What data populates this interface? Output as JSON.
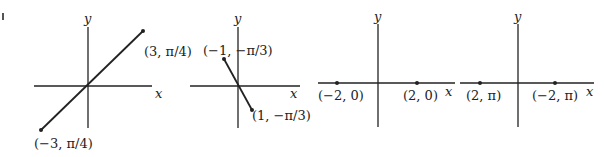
{
  "figure_mark": "|",
  "graphs": [
    {
      "x_label": "x",
      "y_label": "y",
      "points": [
        {
          "label": "(3, π/4)",
          "r": 3,
          "theta": "π/4"
        },
        {
          "label": "(−3, π/4)",
          "r": -3,
          "theta": "π/4"
        }
      ]
    },
    {
      "x_label": "x",
      "y_label": "y",
      "points": [
        {
          "label": "(−1, −π/3)",
          "r": -1,
          "theta": "−π/3"
        },
        {
          "label": "(1, −π/3)",
          "r": 1,
          "theta": "−π/3"
        }
      ]
    },
    {
      "x_label": "x",
      "y_label": "y",
      "points": [
        {
          "label": "(−2, 0)",
          "r": -2,
          "theta": "0"
        },
        {
          "label": "(2, 0)",
          "r": 2,
          "theta": "0"
        }
      ]
    },
    {
      "x_label": "x",
      "y_label": "y",
      "points": [
        {
          "label": "(2, π)",
          "r": 2,
          "theta": "π"
        },
        {
          "label": "(−2, π)",
          "r": -2,
          "theta": "π"
        }
      ]
    }
  ]
}
